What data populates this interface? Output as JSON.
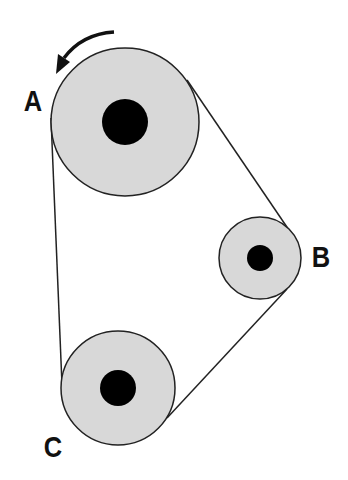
{
  "diagram": {
    "type": "belt-pulley-system",
    "colors": {
      "pulley_fill": "#d8d8d8",
      "hub": "#000000",
      "stroke": "#222222",
      "background": "#ffffff"
    },
    "pulleys": [
      {
        "id": "A",
        "label": "A",
        "cx": 125,
        "cy": 122,
        "r": 74,
        "hub_r": 23
      },
      {
        "id": "B",
        "label": "B",
        "cx": 260,
        "cy": 258,
        "r": 41,
        "hub_r": 13
      },
      {
        "id": "C",
        "label": "C",
        "cx": 118,
        "cy": 388,
        "r": 57,
        "hub_r": 18
      }
    ],
    "rotation_arrow": {
      "pulley": "A",
      "direction": "counterclockwise"
    }
  }
}
